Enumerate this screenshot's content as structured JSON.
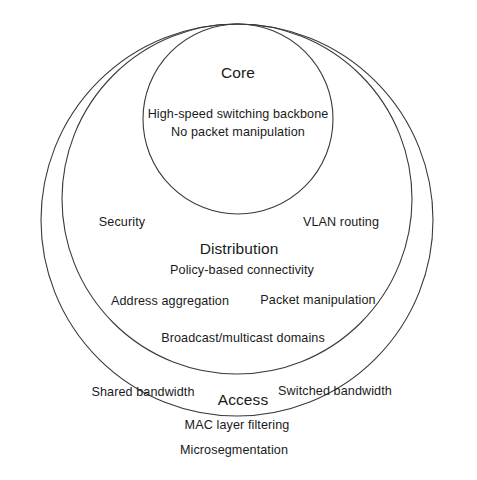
{
  "diagram": {
    "type": "concentric-circles",
    "stroke_color": "#3a3a3a",
    "background_color": "#ffffff",
    "layers": [
      {
        "id": "core",
        "heading": "Core",
        "heading_x": 238,
        "heading_y": 73,
        "ring": {
          "cx": 238,
          "cy": 119,
          "r": 95
        },
        "items": [
          {
            "text": "High-speed switching backbone",
            "x": 238,
            "y": 114
          },
          {
            "text": "No packet manipulation",
            "x": 238,
            "y": 132
          }
        ]
      },
      {
        "id": "distribution",
        "heading": "Distribution",
        "heading_x": 239,
        "heading_y": 249,
        "ring": {
          "cx": 237,
          "cy": 199,
          "r": 175
        },
        "items": [
          {
            "text": "Security",
            "x": 122,
            "y": 222
          },
          {
            "text": "VLAN routing",
            "x": 341,
            "y": 222
          },
          {
            "text": "Policy-based connectivity",
            "x": 242,
            "y": 270
          },
          {
            "text": "Address aggregation",
            "x": 170,
            "y": 301
          },
          {
            "text": "Packet manipulation",
            "x": 318,
            "y": 300
          },
          {
            "text": "Broadcast/multicast domains",
            "x": 243,
            "y": 338
          }
        ]
      },
      {
        "id": "access",
        "heading": "Access",
        "heading_x": 243,
        "heading_y": 400,
        "ring": {
          "cx": 237,
          "cy": 220,
          "r": 196
        },
        "items": [
          {
            "text": "Shared bandwidth",
            "x": 143,
            "y": 392
          },
          {
            "text": "Switched bandwidth",
            "x": 335,
            "y": 391
          },
          {
            "text": "MAC layer filtering",
            "x": 237,
            "y": 425
          },
          {
            "text": "Microsegmentation",
            "x": 234,
            "y": 450
          }
        ]
      }
    ]
  }
}
